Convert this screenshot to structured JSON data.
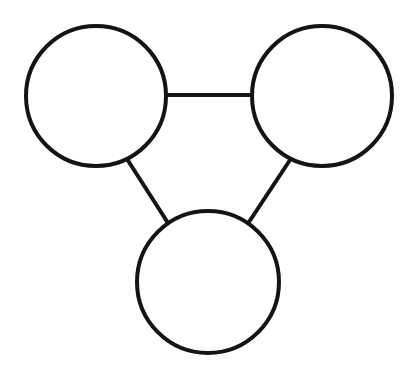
{
  "diagram": {
    "type": "graph",
    "colors": {
      "background": "#ffffff",
      "stroke": "#141414",
      "node_fill": "#ffffff"
    },
    "stroke_width": 4,
    "nodes": [
      {
        "id": "top-left",
        "cx": 96,
        "cy": 96,
        "r": 70,
        "label": ""
      },
      {
        "id": "top-right",
        "cx": 322,
        "cy": 96,
        "r": 70,
        "label": ""
      },
      {
        "id": "bottom",
        "cx": 208,
        "cy": 282,
        "r": 71,
        "label": ""
      }
    ],
    "edges": [
      {
        "from": "top-left",
        "to": "top-right",
        "x1": 166,
        "y1": 95,
        "x2": 252,
        "y2": 95
      },
      {
        "from": "top-left",
        "to": "bottom",
        "x1": 127,
        "y1": 159,
        "x2": 168,
        "y2": 223
      },
      {
        "from": "top-right",
        "to": "bottom",
        "x1": 290,
        "y1": 160,
        "x2": 249,
        "y2": 222
      }
    ]
  }
}
